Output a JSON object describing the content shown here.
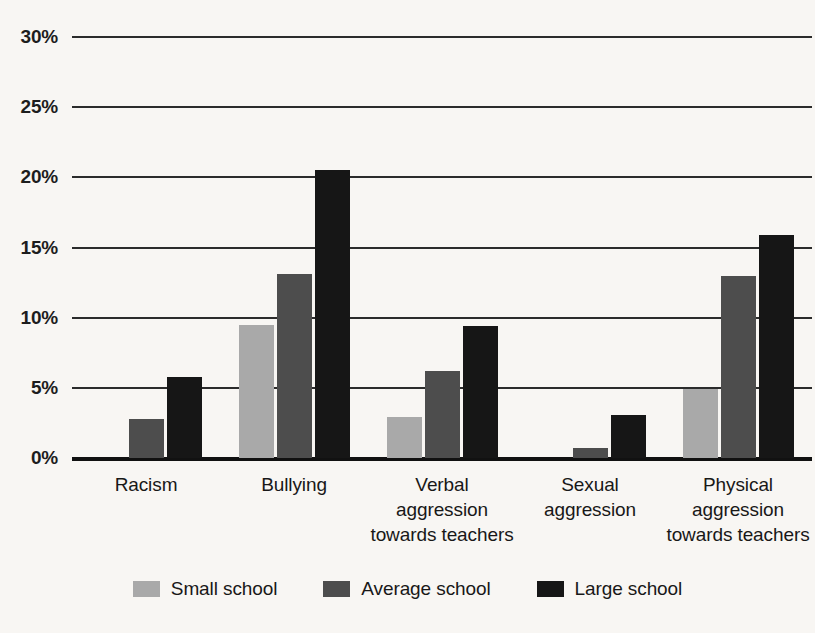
{
  "chart_data": {
    "type": "bar",
    "title": "",
    "xlabel": "",
    "ylabel": "",
    "ylim": [
      0,
      30
    ],
    "ytick_labels": [
      "0%",
      "5%",
      "10%",
      "15%",
      "20%",
      "25%",
      "30%"
    ],
    "ytick_values": [
      0,
      5,
      10,
      15,
      20,
      25,
      30
    ],
    "grid": true,
    "legend_position": "bottom",
    "categories": [
      "Racism",
      "Bullying",
      "Verbal aggression towards teachers",
      "Sexual aggression",
      "Physical aggression towards teachers"
    ],
    "category_lines": [
      [
        "Racism"
      ],
      [
        "Bullying"
      ],
      [
        "Verbal",
        "aggression",
        "towards teachers"
      ],
      [
        "Sexual",
        "aggression"
      ],
      [
        "Physical",
        "aggression",
        "towards teachers"
      ]
    ],
    "series": [
      {
        "name": "Small school",
        "color": "#a9a9a9",
        "values": [
          0,
          9.5,
          2.9,
          0,
          4.9
        ]
      },
      {
        "name": "Average school",
        "color": "#4d4d4d",
        "values": [
          2.8,
          13.1,
          6.2,
          0.7,
          13.0
        ]
      },
      {
        "name": "Large school",
        "color": "#161616",
        "values": [
          5.8,
          20.5,
          9.4,
          3.1,
          15.9
        ]
      }
    ]
  },
  "colors": {
    "background": "#f8f6f3",
    "gridline": "#2b2b2b",
    "axis": "#111111",
    "text": "#181818",
    "small_school": "#a9a9a9",
    "average_school": "#4d4d4d",
    "large_school": "#161616"
  }
}
